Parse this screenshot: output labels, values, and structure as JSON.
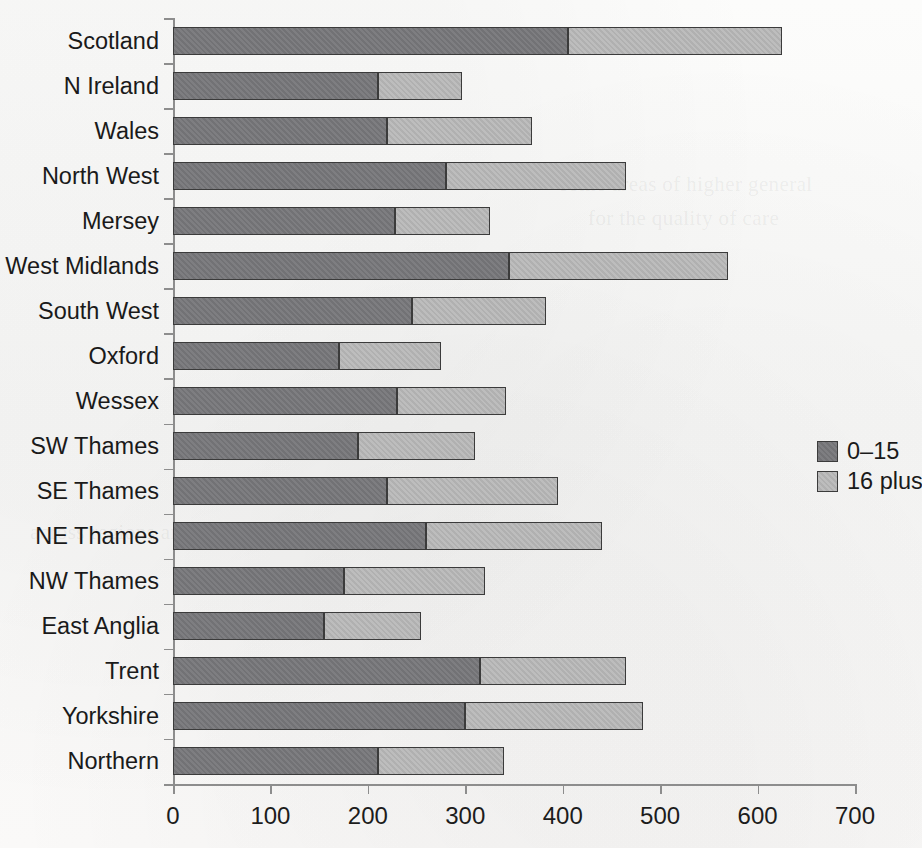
{
  "chart_data": {
    "type": "bar",
    "orientation": "horizontal",
    "stacked": true,
    "title": "",
    "subtitle": "",
    "xlabel": "",
    "ylabel": "",
    "xlim": [
      0,
      700
    ],
    "xticks": [
      0,
      100,
      200,
      300,
      400,
      500,
      600,
      700
    ],
    "xtick_labels": [
      "0",
      "100",
      "200",
      "300",
      "400",
      "500",
      "600",
      "700"
    ],
    "grid": false,
    "legend_position": "right",
    "categories": [
      "Scotland",
      "N Ireland",
      "Wales",
      "North West",
      "Mersey",
      "West Midlands",
      "South West",
      "Oxford",
      "Wessex",
      "SW Thames",
      "SE Thames",
      "NE Thames",
      "NW Thames",
      "East Anglia",
      "Trent",
      "Yorkshire",
      "Northern"
    ],
    "series": [
      {
        "name": "0–15",
        "color": "#77777a",
        "values": [
          405,
          210,
          220,
          280,
          228,
          345,
          245,
          170,
          230,
          190,
          220,
          260,
          175,
          155,
          315,
          300,
          210
        ]
      },
      {
        "name": "16 plus",
        "color": "#b6b6b6",
        "values": [
          220,
          87,
          148,
          185,
          97,
          225,
          138,
          105,
          112,
          120,
          175,
          180,
          145,
          100,
          150,
          182,
          130
        ]
      }
    ],
    "totals": [
      625,
      297,
      368,
      465,
      325,
      570,
      383,
      275,
      342,
      310,
      395,
      440,
      320,
      255,
      465,
      482,
      340
    ]
  },
  "legend": {
    "items": [
      {
        "label": "0–15",
        "color": "#77777a"
      },
      {
        "label": "16 plus",
        "color": "#b6b6b6"
      }
    ]
  },
  "axes": {
    "x_axis_name": "value-axis",
    "y_axis_name": "region-axis"
  },
  "background_ghost_text": [
    "some areas of higher general",
    "for the quality of care",
    "across regions and districts in",
    "of the regional health authority",
    "and the number of children",
    "in each of the districts served"
  ]
}
